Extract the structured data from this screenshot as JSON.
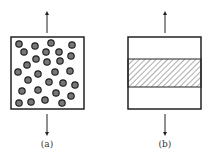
{
  "figures": [
    {
      "id": "a",
      "label": "(a)",
      "description": "particle-dispersed composite under tension",
      "particle_count": 30
    },
    {
      "id": "b",
      "label": "(b)",
      "description": "layered composite with hatched middle layer under tension"
    }
  ],
  "colors": {
    "stroke": "#222222",
    "particle_fill": "#777777",
    "background": "#ffffff"
  }
}
